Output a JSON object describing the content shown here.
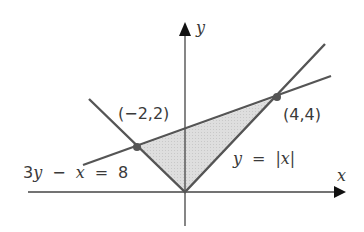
{
  "figure": {
    "type": "coordinate-plane-diagram",
    "axes": {
      "x_label": "x",
      "y_label": "y"
    },
    "curves": [
      {
        "name": "absolute-value",
        "equation_label": "y = |x|",
        "label_parts": [
          "y",
          "=",
          "|x|"
        ]
      },
      {
        "name": "line",
        "equation_label": "3y − x = 8",
        "label_parts": [
          "3y",
          "−",
          "x",
          "=",
          "8"
        ]
      }
    ],
    "points": [
      {
        "name": "left-intersection",
        "label": "(−2,2)",
        "x": -2,
        "y": 2
      },
      {
        "name": "right-intersection",
        "label": "(4,4)",
        "x": 4,
        "y": 4
      }
    ],
    "shaded_region": {
      "description": "Region between y = |x| and 3y − x = 8",
      "vertices": [
        [
          -2,
          2
        ],
        [
          0,
          0
        ],
        [
          4,
          4
        ]
      ]
    },
    "colors": {
      "lines": "#555555",
      "axes": "#444444",
      "shade": "#d9d9d9",
      "points": "#555555",
      "text": "#3a3a3a"
    }
  }
}
